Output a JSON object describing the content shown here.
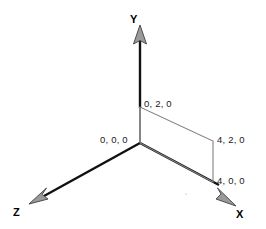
{
  "diagram": {
    "background_color": "#ffffff",
    "axis_color_dark": "#111111",
    "axis_color_light": "#8c8c8c",
    "rectangle_color": "#808080",
    "arrowhead_fill": "#9a9a9a",
    "arrowhead_stroke": "#4d4d4d",
    "text_color": "#1a1a1a"
  },
  "axes": {
    "y": {
      "label": "Y",
      "direction": "up"
    },
    "x": {
      "label": "X",
      "direction": "down-right"
    },
    "z": {
      "label": "Z",
      "direction": "down-left"
    }
  },
  "points": {
    "origin": {
      "label": "0, 0, 0",
      "x": 0,
      "y": 0,
      "z": 0
    },
    "top_left": {
      "label": "0, 2, 0",
      "x": 0,
      "y": 2,
      "z": 0
    },
    "top_right": {
      "label": "4, 2, 0",
      "x": 4,
      "y": 2,
      "z": 0
    },
    "bottom_right": {
      "label": "4, 0, 0",
      "x": 4,
      "y": 0,
      "z": 0
    }
  },
  "shape": {
    "name": "rectangle",
    "vertices": [
      "0, 0, 0",
      "0, 2, 0",
      "4, 2, 0",
      "4, 0, 0"
    ]
  }
}
